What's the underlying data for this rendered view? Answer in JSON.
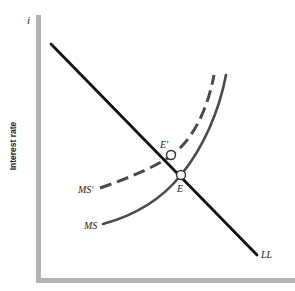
{
  "diagram": {
    "y_axis": {
      "symbol": "i",
      "label": "Interest rate"
    },
    "x_axis": {
      "label": ""
    },
    "curves": [
      {
        "id": "LL",
        "label": "LL",
        "style": "solid",
        "color": "#111111"
      },
      {
        "id": "MS",
        "label": "MS",
        "style": "solid",
        "color": "#444444"
      },
      {
        "id": "MS_prime",
        "label": "MS′",
        "style": "dashed",
        "color": "#444444"
      }
    ],
    "points": [
      {
        "id": "E",
        "label": "E"
      },
      {
        "id": "E_prime",
        "label": "E′"
      }
    ],
    "colors": {
      "axis": "#b3b3b3",
      "ll_line": "#111111",
      "ms_curves": "#4a4a4a",
      "point_fill": "#ffffff"
    }
  }
}
